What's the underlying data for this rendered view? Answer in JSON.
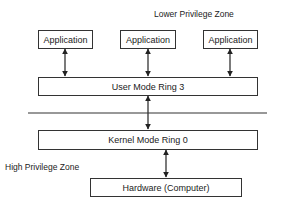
{
  "zones": {
    "lower": "Lower Privilege Zone",
    "high": "High Privilege Zone"
  },
  "applications": [
    {
      "label": "Application"
    },
    {
      "label": "Application"
    },
    {
      "label": "Application"
    }
  ],
  "user_mode": {
    "label": "User Mode Ring 3"
  },
  "kernel_mode": {
    "label": "Kernel Mode Ring 0"
  },
  "hardware": {
    "label": "Hardware (Computer)"
  },
  "colors": {
    "stroke": "#333333",
    "background": "#ffffff",
    "text": "#222222"
  }
}
